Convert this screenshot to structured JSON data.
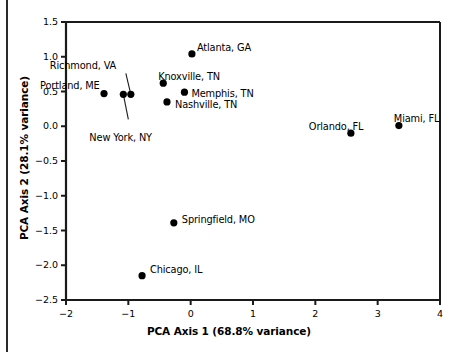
{
  "chart_data": {
    "type": "scatter",
    "title": "",
    "xlabel": "PCA Axis 1 (68.8% variance)",
    "ylabel": "PCA Axis 2 (28.1% variance)",
    "xlim": [
      -2,
      4
    ],
    "ylim": [
      -2.5,
      1.5
    ],
    "xticks": [
      "-2",
      "-1",
      "0",
      "1",
      "2",
      "3",
      "4"
    ],
    "xtick_values": [
      -2,
      -1,
      0,
      1,
      2,
      3,
      4
    ],
    "yticks": [
      "1.5",
      "1.0",
      "0.5",
      "0.0",
      "-0.5",
      "-1.0",
      "-1.5",
      "-2.0",
      "-2.5"
    ],
    "ytick_values": [
      1.5,
      1.0,
      0.5,
      0.0,
      -0.5,
      -1.0,
      -1.5,
      -2.0,
      -2.5
    ],
    "grid": false,
    "legend": false,
    "marker": "filled-circle",
    "marker_color": "#000000",
    "points": [
      {
        "label": "Portland, ME",
        "x": -1.39,
        "y": 0.47,
        "label_dx": -64,
        "label_dy": -14,
        "leader": false
      },
      {
        "label": "New York, NY",
        "x": -1.08,
        "y": 0.46,
        "label_dx": -34,
        "label_dy": 38,
        "leader": true,
        "leader_x": -1.0,
        "leader_y": 0.1
      },
      {
        "label": "Richmond, VA",
        "x": -0.96,
        "y": 0.46,
        "label_dx": -81,
        "label_dy": -34,
        "leader": true,
        "leader_x": -1.04,
        "leader_y": 0.76
      },
      {
        "label": "Atlanta, GA",
        "x": 0.02,
        "y": 1.04,
        "label_dx": 5,
        "label_dy": -12,
        "leader": false
      },
      {
        "label": "Knoxville, TN",
        "x": -0.44,
        "y": 0.62,
        "label_dx": -5,
        "label_dy": -12,
        "leader": false
      },
      {
        "label": "Memphis, TN",
        "x": -0.1,
        "y": 0.49,
        "label_dx": 7,
        "label_dy": -4,
        "leader": false
      },
      {
        "label": "Nashville, TN",
        "x": -0.38,
        "y": 0.35,
        "label_dx": 8,
        "label_dy": -3,
        "leader": false
      },
      {
        "label": "Springfield, MO",
        "x": -0.27,
        "y": -1.39,
        "label_dx": 8,
        "label_dy": -9,
        "leader": false
      },
      {
        "label": "Chicago, IL",
        "x": -0.78,
        "y": -2.15,
        "label_dx": 8,
        "label_dy": -12,
        "leader": false
      },
      {
        "label": "Orlando, FL",
        "x": 2.57,
        "y": -0.1,
        "label_dx": -42,
        "label_dy": -12,
        "leader": false
      },
      {
        "label": "Miami, FL",
        "x": 3.34,
        "y": 0.01,
        "label_dx": -5,
        "label_dy": -13,
        "leader": false
      }
    ]
  }
}
